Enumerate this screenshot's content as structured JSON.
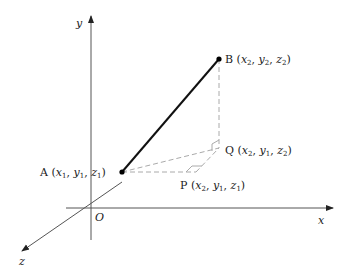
{
  "diagram": {
    "axes": {
      "x_label": "x",
      "y_label": "y",
      "z_label": "z",
      "origin_label": "O"
    },
    "points": {
      "A": {
        "name": "A",
        "coords": "(x1, y1, z1)",
        "x": "x",
        "xs": "1",
        "y": "y",
        "ys": "1",
        "z": "z",
        "zs": "1"
      },
      "B": {
        "name": "B",
        "coords": "(x2, y2, z2)",
        "x": "x",
        "xs": "2",
        "y": "y",
        "ys": "2",
        "z": "z",
        "zs": "2"
      },
      "P": {
        "name": "P",
        "coords": "(x2, y1, z1)",
        "x": "x",
        "xs": "2",
        "y": "y",
        "ys": "1",
        "z": "z",
        "zs": "1"
      },
      "Q": {
        "name": "Q",
        "coords": "(x2, y1, z2)",
        "x": "x",
        "xs": "2",
        "y": "y",
        "ys": "1",
        "z": "z",
        "zs": "2"
      }
    },
    "colors": {
      "axis": "#333333",
      "segment": "#111111",
      "dashed": "#aaaaaa"
    }
  }
}
